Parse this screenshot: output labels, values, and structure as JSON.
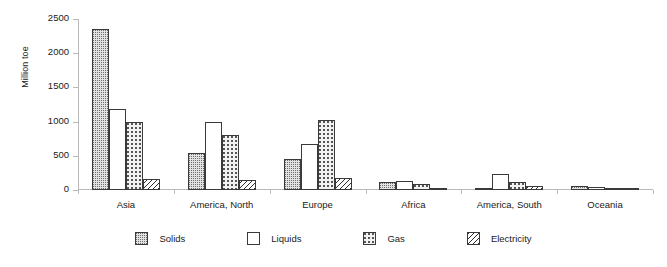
{
  "chart_data": {
    "type": "bar",
    "title": "",
    "subtitle": "",
    "xlabel": "",
    "ylabel": "Million toe",
    "ylim": [
      0,
      2500
    ],
    "ytick_values": [
      0,
      500,
      1000,
      1500,
      2000,
      2500
    ],
    "ytick_labels": [
      "0",
      "500",
      "1000",
      "1500",
      "2000",
      "2500"
    ],
    "grid": false,
    "legend_position": "bottom",
    "categories": [
      "Asia",
      "America, North",
      "Europe",
      "Africa",
      "America, South",
      "Oceania"
    ],
    "series": [
      {
        "name": "Solids",
        "pattern": "fine-dots",
        "values": [
          2360,
          540,
          460,
          110,
          20,
          55
        ]
      },
      {
        "name": "Liquids",
        "pattern": "white",
        "values": [
          1180,
          1000,
          680,
          130,
          230,
          50
        ]
      },
      {
        "name": "Gas",
        "pattern": "sparse-dots",
        "values": [
          990,
          800,
          1020,
          85,
          110,
          25
        ]
      },
      {
        "name": "Electricity",
        "pattern": "diagonal-hatch",
        "values": [
          160,
          140,
          180,
          20,
          55,
          15
        ]
      }
    ]
  },
  "axis": {
    "y_title": "Million toe",
    "ticks": [
      "2500",
      "2000",
      "1500",
      "1000",
      "500",
      "0"
    ]
  },
  "categories": [
    {
      "label": "Asia"
    },
    {
      "label": "America, North"
    },
    {
      "label": "Europe"
    },
    {
      "label": "Africa"
    },
    {
      "label": "America, South"
    },
    {
      "label": "Oceania"
    }
  ],
  "legend": {
    "items": [
      {
        "label": "Solids"
      },
      {
        "label": "Liquids"
      },
      {
        "label": "Gas"
      },
      {
        "label": "Electricity"
      }
    ]
  }
}
